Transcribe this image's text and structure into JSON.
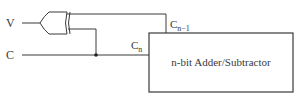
{
  "diagram": {
    "inputs": [
      {
        "id": "V",
        "label": "V"
      },
      {
        "id": "C",
        "label": "C"
      }
    ],
    "gate": {
      "type": "XOR",
      "inputs": [
        "V",
        "C"
      ]
    },
    "block": {
      "label": "n-bit Adder/Subtractor"
    },
    "ports": {
      "cn": {
        "base": "C",
        "sub": "n"
      },
      "cn_minus_1": {
        "base": "C",
        "sub": "n−1"
      }
    },
    "colors": {
      "line": "#3a3a3a",
      "background": "#ffffff"
    }
  }
}
